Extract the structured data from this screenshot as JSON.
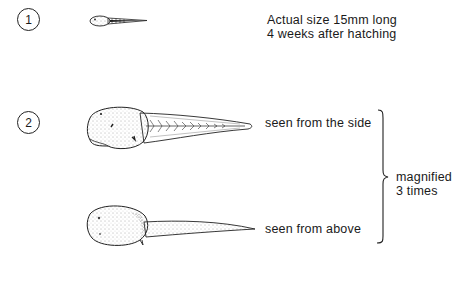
{
  "figure": {
    "items": [
      {
        "number": "1",
        "caption_lines": [
          "Actual size 15mm long",
          "4 weeks after hatching"
        ]
      },
      {
        "number": "2",
        "views": [
          {
            "label": "seen from the side"
          },
          {
            "label": "seen from above"
          }
        ],
        "bracket_note_lines": [
          "magnified",
          "3 times"
        ]
      }
    ],
    "colors": {
      "ink": "#1a1a1a",
      "background": "#ffffff"
    }
  }
}
